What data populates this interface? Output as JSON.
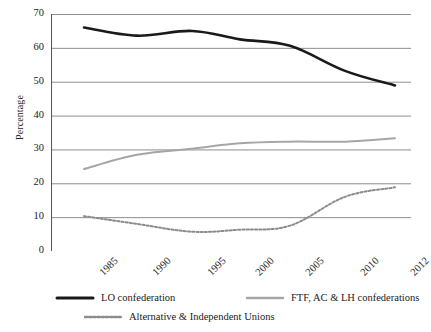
{
  "chart_data": {
    "type": "line",
    "title": "",
    "xlabel": "",
    "ylabel": "Percentage",
    "ylim": [
      0,
      70
    ],
    "ytick_step": 10,
    "yticks": [
      70,
      60,
      50,
      40,
      30,
      20,
      10,
      0
    ],
    "categories": [
      "1985",
      "1990",
      "1995",
      "2000",
      "2005",
      "2010",
      "2012"
    ],
    "x": [
      1985,
      1990,
      1995,
      2000,
      2005,
      2010,
      2012
    ],
    "grid": true,
    "legend_position": "bottom",
    "series": [
      {
        "name": "LO  confederation",
        "style": "solid",
        "color": "#1a1a1a",
        "width": 2.6,
        "values": [
          66.0,
          63.6,
          65.0,
          62.5,
          60.6,
          53.2,
          48.9
        ]
      },
      {
        "name": "FTF, AC & LH confederations",
        "style": "solid",
        "color": "#a6a6a6",
        "width": 2.0,
        "values": [
          24.2,
          28.4,
          30.2,
          31.8,
          32.3,
          32.3,
          33.3
        ]
      },
      {
        "name": "Alternative & Independent Unions",
        "style": "dotted",
        "color": "#8c8c8c",
        "width": 2.0,
        "values": [
          10.3,
          8.0,
          5.7,
          6.3,
          7.5,
          16.0,
          18.8
        ]
      }
    ]
  },
  "axes": {
    "y_title": "Percentage",
    "y_tick_labels": [
      "70",
      "60",
      "50",
      "40",
      "30",
      "20",
      "10",
      "0"
    ],
    "x_tick_labels": [
      "1985",
      "1990",
      "1995",
      "2000",
      "2005",
      "2010",
      "2012"
    ]
  },
  "legend": {
    "items": [
      {
        "label": "LO  confederation",
        "swatch": "solid-black-line-icon"
      },
      {
        "label": "FTF, AC & LH confederations",
        "swatch": "solid-gray-line-icon"
      },
      {
        "label": "Alternative & Independent Unions",
        "swatch": "dotted-gray-line-icon"
      }
    ]
  },
  "colors": {
    "series_lo": "#1a1a1a",
    "series_ftf": "#a6a6a6",
    "series_alt": "#8c8c8c",
    "gridline": "#808080",
    "axis": "#595959",
    "background": "#ffffff"
  }
}
